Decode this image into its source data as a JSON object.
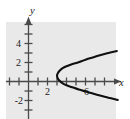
{
  "figure": {
    "width": 130,
    "height": 119,
    "background_color": "#ffffff",
    "plot_background_color": "#e9e9e9"
  },
  "chart_data": {
    "type": "line",
    "title": "",
    "subtitle": "",
    "xlabel": "x",
    "ylabel": "y",
    "grid": false,
    "legend": null,
    "legend_position": "none",
    "curve_color": "#101010",
    "axis_color": "#4a4a4a",
    "xlim": [
      -2.4,
      9.4
    ],
    "ylim": [
      -3.9,
      6.7
    ],
    "x_ticks": [
      -2,
      0,
      2,
      4,
      6,
      8
    ],
    "x_tick_labels": [
      "",
      "",
      "2",
      "",
      "6",
      ""
    ],
    "y_ticks": [
      -3,
      -2,
      -1,
      1,
      2,
      3,
      4,
      5,
      6
    ],
    "y_tick_labels": [
      "",
      "-2",
      "",
      "",
      "2",
      "",
      "4",
      "",
      ""
    ],
    "vertex": [
      3.0,
      0.6
    ],
    "equation": "x = (y - 0.6)^2 + 3",
    "series": [
      {
        "name": "parabola",
        "orientation": "horizontal",
        "points": [
          [
            9.3,
            3.2
          ],
          [
            8.0,
            2.9
          ],
          [
            7.0,
            2.6
          ],
          [
            6.0,
            2.3
          ],
          [
            5.2,
            2.0
          ],
          [
            4.5,
            1.8
          ],
          [
            4.0,
            1.6
          ],
          [
            3.6,
            1.4
          ],
          [
            3.3,
            1.15
          ],
          [
            3.1,
            0.9
          ],
          [
            3.0,
            0.6
          ],
          [
            3.1,
            0.3
          ],
          [
            3.3,
            0.05
          ],
          [
            3.6,
            -0.2
          ],
          [
            4.0,
            -0.4
          ],
          [
            4.6,
            -0.6
          ],
          [
            5.3,
            -0.85
          ],
          [
            6.2,
            -1.1
          ],
          [
            7.2,
            -1.4
          ],
          [
            8.4,
            -1.7
          ],
          [
            9.4,
            -1.95
          ]
        ]
      }
    ]
  },
  "axes": {
    "y_axis": {
      "letter": "y",
      "arrow": "up"
    },
    "x_axis": {
      "letter": "x",
      "arrow": "right"
    }
  },
  "labels": {
    "y4": "4",
    "y2": "2",
    "yneg2": "-2",
    "x2": "2",
    "x6": "6",
    "x_letter": "x",
    "y_letter": "y"
  }
}
